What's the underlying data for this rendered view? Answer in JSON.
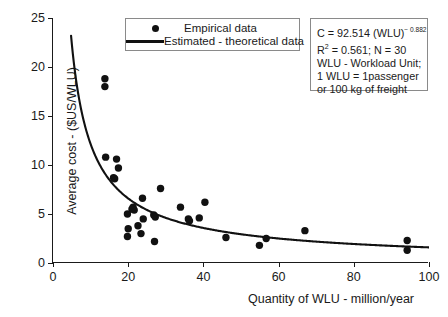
{
  "chart_data": {
    "type": "scatter",
    "title": "",
    "xlabel": "Quantity of WLU - million/year",
    "ylabel": "Average cost - ($US/WLU)",
    "xlim": [
      0,
      100
    ],
    "ylim": [
      0,
      25
    ],
    "xticks": [
      0,
      20,
      40,
      60,
      80,
      100
    ],
    "yticks": [
      0,
      5,
      10,
      15,
      20,
      25
    ],
    "grid": false,
    "legend_position": "top-center",
    "series": [
      {
        "name": "Empirical data",
        "type": "scatter",
        "marker": "circle",
        "color": "#111111",
        "points": [
          [
            13.8,
            18.8
          ],
          [
            13.8,
            18.0
          ],
          [
            14.0,
            10.8
          ],
          [
            16.9,
            10.6
          ],
          [
            17.4,
            9.7
          ],
          [
            16.4,
            8.6
          ],
          [
            16.1,
            8.7
          ],
          [
            19.8,
            5.0
          ],
          [
            20.0,
            3.5
          ],
          [
            19.8,
            2.7
          ],
          [
            21.3,
            5.7
          ],
          [
            21.6,
            5.4
          ],
          [
            21.0,
            5.5
          ],
          [
            22.6,
            3.8
          ],
          [
            23.4,
            3.0
          ],
          [
            23.8,
            6.6
          ],
          [
            24.0,
            4.5
          ],
          [
            26.8,
            4.9
          ],
          [
            27.2,
            4.7
          ],
          [
            27.0,
            2.2
          ],
          [
            28.6,
            7.6
          ],
          [
            33.9,
            5.7
          ],
          [
            36.0,
            4.5
          ],
          [
            36.3,
            4.3
          ],
          [
            38.9,
            4.6
          ],
          [
            40.4,
            6.2
          ],
          [
            46.0,
            2.6
          ],
          [
            54.9,
            1.8
          ],
          [
            56.7,
            2.5
          ],
          [
            67.0,
            3.3
          ],
          [
            94.2,
            2.3
          ],
          [
            94.2,
            1.3
          ]
        ]
      },
      {
        "name": "Estimated - theoretical data",
        "type": "line",
        "color": "#111111",
        "equation": "C = 92.514 * WLU^-0.882",
        "coefficient": 92.514,
        "exponent": -0.882,
        "x_start": 4.8,
        "x_end": 100
      }
    ]
  },
  "legend": {
    "items": [
      {
        "label": "Empirical data",
        "key": "marker-dot-icon"
      },
      {
        "label": "Estimated - theoretical data",
        "key": "line-swatch-icon"
      }
    ]
  },
  "annotation": {
    "equation_prefix": "C = 92.514 (WLU)",
    "equation_exponent": "− 0.882",
    "r_label": "R",
    "r_exponent": "2",
    "r_value": " = 0.561; N = 30",
    "lines": [
      "WLU - Workload Unit;",
      "1 WLU = 1passenger",
      "or 100 kg of freight"
    ]
  },
  "axes": {
    "y_title": "Average cost - ($US/WLU)",
    "x_title": "Quantity of WLU - million/year",
    "y_tick_labels": [
      "25",
      "20",
      "15",
      "10",
      "5",
      "0"
    ],
    "x_tick_labels": [
      "0",
      "20",
      "40",
      "60",
      "80",
      "100"
    ]
  }
}
